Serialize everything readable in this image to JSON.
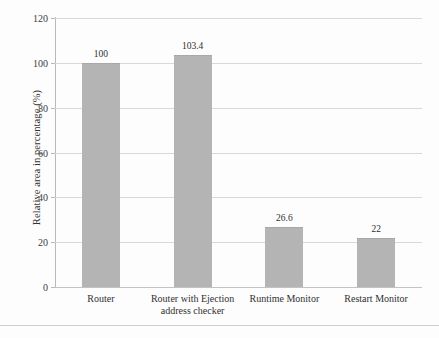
{
  "chart_data": {
    "type": "bar",
    "title": "",
    "xlabel": "",
    "ylabel": "Relative area in percentage (%)",
    "ylim": [
      0,
      120
    ],
    "yticks": [
      0,
      20,
      40,
      60,
      80,
      100,
      120
    ],
    "ytick_labels": [
      "0",
      "20",
      "40",
      "60",
      "80",
      "100",
      "120"
    ],
    "grid": true,
    "legend": "none",
    "categories": [
      "Router",
      "Router with Ejection address checker",
      "Runtime Monitor",
      "Restart Monitor"
    ],
    "values": [
      100,
      103.4,
      26.6,
      22
    ],
    "value_labels": [
      "100",
      "103.4",
      "26.6",
      "22"
    ],
    "bar_color": "#b4b4b4",
    "gridline_color": "#d8d8d8",
    "axis_color": "#b9b9b9"
  },
  "axis": {
    "y_title": "Relative area in percentage (%)",
    "ticks": [
      {
        "label": "120",
        "value": 120
      },
      {
        "label": "100",
        "value": 100
      },
      {
        "label": "80",
        "value": 80
      },
      {
        "label": "60",
        "value": 60
      },
      {
        "label": "40",
        "value": 40
      },
      {
        "label": "20",
        "value": 20
      },
      {
        "label": "0",
        "value": 0
      }
    ]
  },
  "bars": [
    {
      "category_line1": "Router",
      "category_line2": "",
      "value_label": "100",
      "value": 100
    },
    {
      "category_line1": "Router with Ejection",
      "category_line2": "address checker",
      "value_label": "103.4",
      "value": 103.4
    },
    {
      "category_line1": "Runtime Monitor",
      "category_line2": "",
      "value_label": "26.6",
      "value": 26.6
    },
    {
      "category_line1": "Restart Monitor",
      "category_line2": "",
      "value_label": "22",
      "value": 22
    }
  ]
}
